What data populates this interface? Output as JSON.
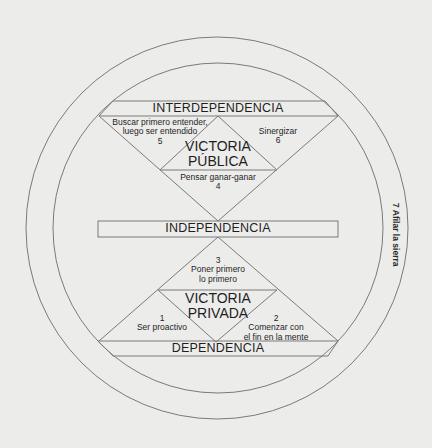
{
  "diagram": {
    "colors": {
      "background": "#ececea",
      "line": "#7a7a7a",
      "text": "#1e1e1e"
    },
    "bands": {
      "interdependencia": "INTERDEPENDENCIA",
      "independencia": "INDEPENDENCIA",
      "dependencia": "DEPENDENCIA"
    },
    "victories": {
      "publica": [
        "VICTORIA",
        "PÚBLICA"
      ],
      "privada": [
        "VICTORIA",
        "PRIVADA"
      ]
    },
    "habits": [
      {
        "number": "1",
        "lines": [
          "Ser proactivo"
        ]
      },
      {
        "number": "2",
        "lines": [
          "Comenzar con",
          "el fin en la mente"
        ]
      },
      {
        "number": "3",
        "lines": [
          "Poner primero",
          "lo primero"
        ]
      },
      {
        "number": "4",
        "lines": [
          "Pensar ganar-ganar"
        ]
      },
      {
        "number": "5",
        "lines": [
          "Buscar primero entender,",
          "luego ser entendido"
        ]
      },
      {
        "number": "6",
        "lines": [
          "Sinergizar"
        ]
      },
      {
        "number": "7",
        "lines": [
          "Afilar la sierra"
        ]
      }
    ],
    "outer_ring_label": "7 Afilar la sierra"
  }
}
